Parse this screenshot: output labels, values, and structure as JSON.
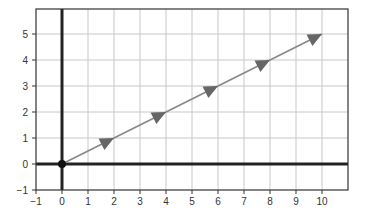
{
  "chart_data": {
    "type": "line",
    "title": "",
    "xlabel": "",
    "ylabel": "",
    "xlim": [
      -1,
      11
    ],
    "ylim": [
      -1,
      6
    ],
    "grid": true,
    "x_ticks": [
      -1,
      0,
      1,
      2,
      3,
      4,
      5,
      6,
      7,
      8,
      9,
      10
    ],
    "x_tick_labels": [
      "−1",
      "0",
      "1",
      "2",
      "3",
      "4",
      "5",
      "6",
      "7",
      "8",
      "9",
      "10"
    ],
    "y_ticks": [
      -1,
      0,
      1,
      2,
      3,
      4,
      5
    ],
    "y_tick_labels": [
      "−1",
      "0",
      "1",
      "2",
      "3",
      "4",
      "5"
    ],
    "series": [
      {
        "name": "vector path",
        "x": [
          0,
          2,
          4,
          6,
          8,
          10
        ],
        "y": [
          0,
          1,
          2,
          3,
          4,
          5
        ],
        "arrowheads_at_segment_ends": true
      }
    ],
    "annotations": [
      {
        "type": "point",
        "x": 0,
        "y": 0,
        "label": "origin"
      }
    ],
    "colors": {
      "grid": "#c8c8c8",
      "axes": "#222222",
      "frame": "#333333",
      "line": "#888888",
      "arrow": "#666666",
      "origin_dot": "#111111"
    }
  }
}
